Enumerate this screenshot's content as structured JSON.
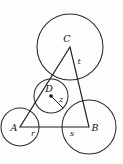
{
  "figure": {
    "kind": "geometry-diagram",
    "background_color": "#fdfdfd",
    "stroke_color": "#2b2b2b",
    "labels": {
      "vertex_a": "A",
      "vertex_b": "B",
      "vertex_c": "C",
      "incenter_d": "D",
      "side_ab_left": "r",
      "side_ab_right": "s",
      "side_cb": "t",
      "inner_radius": "z"
    },
    "circles": [
      {
        "name": "circle-a",
        "label": "A",
        "cx": 20,
        "cy": 127,
        "r": 19
      },
      {
        "name": "circle-b",
        "label": "B",
        "cx": 89,
        "cy": 127,
        "r": 27
      },
      {
        "name": "circle-c",
        "label": "C",
        "cx": 70,
        "cy": 47,
        "r": 33
      },
      {
        "name": "circle-d",
        "label": "D",
        "cx": 51,
        "cy": 96,
        "r": 17
      }
    ],
    "triangle": {
      "name": "triangle-abc",
      "points": "20,127 89,127 70,47",
      "vertices": [
        {
          "label": "A",
          "x": 20,
          "y": 127
        },
        {
          "label": "B",
          "x": 89,
          "y": 127
        },
        {
          "label": "C",
          "x": 70,
          "y": 47
        }
      ]
    },
    "radius_segment": {
      "name": "radius-z",
      "x1": 51,
      "y1": 96,
      "x2": 63,
      "y2": 108
    }
  }
}
